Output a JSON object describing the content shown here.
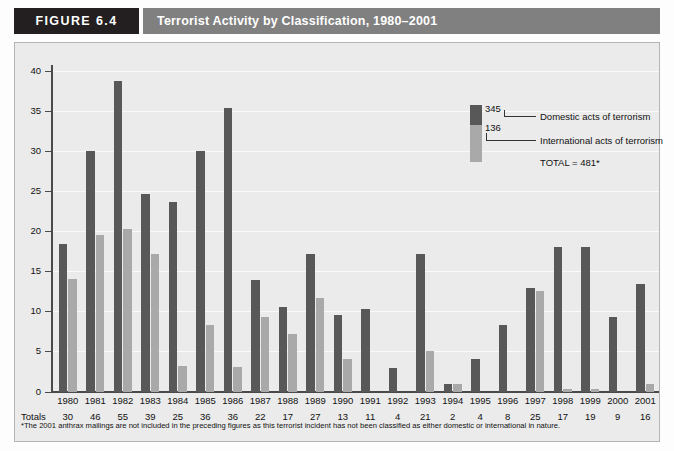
{
  "figure": {
    "tag": "FIGURE 6.4",
    "title": "Terrorist Activity by Classification, 1980–2001"
  },
  "legend": {
    "domestic_value": "345",
    "international_value": "136",
    "domestic_label": "Domestic acts of terrorism",
    "international_label": "International acts of terrorism",
    "total_label": "TOTAL = 481*"
  },
  "totals_row_caption": "Totals",
  "footnote": "*The 2001 anthrax mailings are not included in the preceding figures as this terrorist incident has not been classified as either domestic or international in nature.",
  "colors": {
    "domestic_bar": "#585858",
    "international_bar": "#a9a9a9",
    "tag_background": "#231f20",
    "title_background": "#808080",
    "plot_background": "#ebebeb",
    "axis": "#4a4a4a"
  },
  "chart_data": {
    "type": "bar",
    "title": "Terrorist Activity by Classification, 1980–2001",
    "xlabel": "",
    "ylabel": "",
    "ylim": [
      0,
      40
    ],
    "yticks": [
      0,
      5,
      10,
      15,
      20,
      25,
      30,
      35,
      40
    ],
    "ytick_labels": [
      "0",
      "5",
      "10",
      "15",
      "20",
      "25",
      "30",
      "35",
      "40"
    ],
    "grid": true,
    "legend_position": "upper-right-inside",
    "categories": [
      "1980",
      "1981",
      "1982",
      "1983",
      "1984",
      "1985",
      "1986",
      "1987",
      "1988",
      "1989",
      "1990",
      "1991",
      "1992",
      "1993",
      "1994",
      "1995",
      "1996",
      "1997",
      "1998",
      "1999",
      "2000",
      "2001"
    ],
    "series": [
      {
        "name": "Domestic acts of terrorism",
        "color": "#585858",
        "values": [
          18.4,
          30.0,
          38.7,
          24.7,
          23.6,
          30.0,
          35.4,
          13.9,
          10.5,
          17.2,
          9.6,
          10.3,
          2.9,
          17.2,
          1.0,
          4.0,
          8.3,
          12.9,
          18.0,
          18.0,
          9.3,
          13.4
        ]
      },
      {
        "name": "International acts of terrorism",
        "color": "#a9a9a9",
        "values": [
          14.0,
          19.5,
          20.3,
          17.2,
          3.2,
          8.3,
          3.0,
          9.3,
          7.2,
          11.7,
          4.1,
          0.0,
          0.0,
          5.0,
          0.9,
          0.0,
          0.0,
          12.5,
          0.3,
          0.3,
          0.0,
          1.0
        ]
      }
    ],
    "totals_row_label": "Totals",
    "totals": [
      30,
      46,
      55,
      39,
      25,
      36,
      36,
      22,
      17,
      27,
      13,
      11,
      4,
      21,
      2,
      4,
      8,
      25,
      17,
      19,
      9,
      16
    ]
  }
}
